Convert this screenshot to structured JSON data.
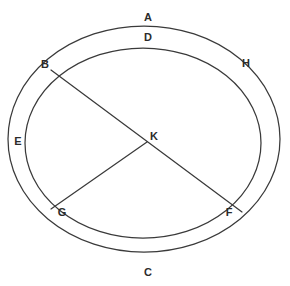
{
  "diagram": {
    "type": "circle-geometry",
    "background_color": "#ffffff",
    "stroke_color": "#3a3a3a",
    "label_color": "#2b2b2b",
    "canvas": {
      "width": 290,
      "height": 286
    },
    "shapes": [
      {
        "name": "outer-ellipse",
        "kind": "ellipse",
        "cx": 144,
        "cy": 139,
        "rx": 136,
        "ry": 113
      },
      {
        "name": "inner-circle",
        "kind": "ellipse",
        "cx": 143,
        "cy": 143,
        "rx": 118,
        "ry": 95
      }
    ],
    "segments": [
      {
        "name": "diameter-b-f",
        "from": "B",
        "to": "F",
        "through": "K",
        "x1": 51,
        "y1": 70,
        "x2": 242,
        "y2": 212
      },
      {
        "name": "radius-g-k",
        "from": "G",
        "to": "K",
        "x1": 51,
        "y1": 209,
        "x2": 147,
        "y2": 142
      }
    ],
    "points": [
      {
        "id": "B",
        "label": "B",
        "x": 51,
        "y": 70,
        "label_x": 45,
        "label_y": 64
      },
      {
        "id": "H",
        "label": "H",
        "x": 241,
        "y": 73,
        "label_x": 246,
        "label_y": 63
      },
      {
        "id": "K",
        "label": "K",
        "x": 147,
        "y": 142,
        "label_x": 154,
        "label_y": 136
      },
      {
        "id": "G",
        "label": "G",
        "x": 51,
        "y": 209,
        "label_x": 62,
        "label_y": 212
      },
      {
        "id": "F",
        "label": "F",
        "x": 242,
        "y": 212,
        "label_x": 229,
        "label_y": 212
      }
    ],
    "arc_labels": [
      {
        "id": "A",
        "label": "A",
        "label_x": 148,
        "label_y": 17,
        "describes": "outer-ellipse-top-arc"
      },
      {
        "id": "D",
        "label": "D",
        "label_x": 148,
        "label_y": 37,
        "describes": "inner-circle-top-arc"
      },
      {
        "id": "E",
        "label": "E",
        "label_x": 18,
        "label_y": 141,
        "describes": "left-lune-between-curves"
      },
      {
        "id": "C",
        "label": "C",
        "label_x": 148,
        "label_y": 272,
        "describes": "outer-ellipse-bottom-arc"
      }
    ]
  }
}
